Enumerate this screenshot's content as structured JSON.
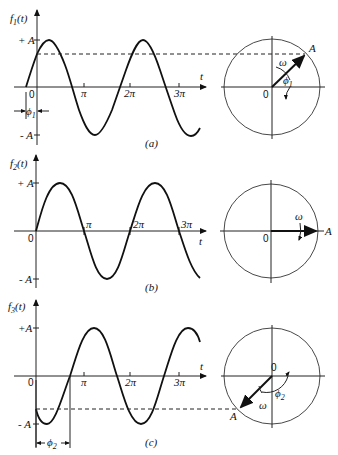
{
  "figure": {
    "panels": [
      {
        "id": "a",
        "caption": "(a)",
        "ylabel": "f",
        "ylabel_sub": "1",
        "ylabel_arg": "(t)",
        "xlabel": "t",
        "y_plus": "+ A",
        "y_minus": "- A",
        "origin": "0",
        "ticks": [
          "π",
          "2π",
          "3π"
        ],
        "phase_label": "ϕ",
        "phase_sub": "1",
        "phasor_label": "A",
        "omega_label": "ω",
        "circle_origin": "0",
        "circle_phase_label": "ϕ",
        "circle_phase_sub": "1"
      },
      {
        "id": "b",
        "caption": "(b)",
        "ylabel": "f",
        "ylabel_sub": "2",
        "ylabel_arg": "(t)",
        "xlabel": "t",
        "y_plus": "+ A",
        "y_minus": "- A",
        "origin": "0",
        "ticks": [
          "π",
          "2π",
          "3π"
        ],
        "phasor_label": "A",
        "omega_label": "ω",
        "circle_origin": "0"
      },
      {
        "id": "c",
        "caption": "(c)",
        "ylabel": "f",
        "ylabel_sub": "3",
        "ylabel_arg": "(t)",
        "xlabel": "t",
        "y_plus": "+A",
        "y_minus": "- A",
        "origin": "0",
        "ticks": [
          "π",
          "2π",
          "3π"
        ],
        "phase_label": "ϕ",
        "phase_sub": "2",
        "phasor_label": "A",
        "omega_label": "ω",
        "circle_origin": "0",
        "circle_phase_label": "ϕ",
        "circle_phase_sub": "2"
      }
    ]
  }
}
